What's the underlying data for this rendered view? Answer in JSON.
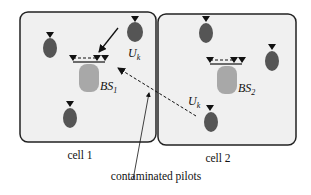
{
  "diagram": {
    "cells": [
      {
        "id": "cell1",
        "label": "cell 1",
        "bs_label": "BS",
        "bs_sub": "1",
        "user_label": "U",
        "user_sub": "k"
      },
      {
        "id": "cell2",
        "label": "cell 2",
        "bs_label": "BS",
        "bs_sub": "2",
        "user_label": "U",
        "user_sub": "k"
      }
    ],
    "annotation": "contaminated pilots",
    "colors": {
      "cell_fill": "#f0f0f0",
      "cell_border": "#222222",
      "user_fill": "#555555",
      "bs_fill": "#a8a8a8",
      "antenna": "#111111"
    }
  }
}
